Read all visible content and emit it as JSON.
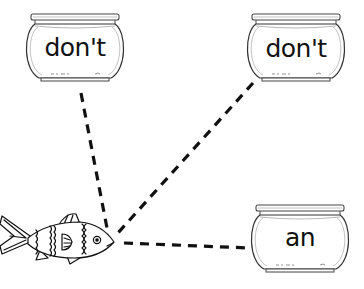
{
  "worksheet": {
    "fish": {
      "icon": "fish-icon",
      "center": [
        56,
        238
      ]
    },
    "bowls": [
      {
        "id": "bowl-top-left",
        "word": "don't",
        "icon": "fishbowl-icon"
      },
      {
        "id": "bowl-top-right",
        "word": "don't",
        "icon": "fishbowl-icon"
      },
      {
        "id": "bowl-bottom-right",
        "word": "an",
        "icon": "fishbowl-icon"
      }
    ],
    "connectors": [
      {
        "from": "fish",
        "to": "bowl-top-left",
        "style": "dashed"
      },
      {
        "from": "fish",
        "to": "bowl-top-right",
        "style": "dashed"
      },
      {
        "from": "fish",
        "to": "bowl-bottom-right",
        "style": "dashed"
      }
    ],
    "colors": {
      "ink": "#111111",
      "background": "#ffffff",
      "glass": "#666666"
    }
  }
}
